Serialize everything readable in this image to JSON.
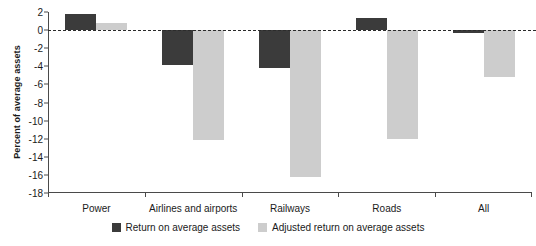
{
  "chart_data": {
    "type": "bar",
    "title": "",
    "xlabel": "",
    "ylabel": "Percent of average assets",
    "categories": [
      "Power",
      "Airlines and airports",
      "Railways",
      "Roads",
      "All"
    ],
    "series": [
      {
        "name": "Return on average assets",
        "color": "#3b3b3b",
        "values": [
          1.8,
          -3.9,
          -4.2,
          1.3,
          -0.3
        ]
      },
      {
        "name": "Adjusted return on average assets",
        "color": "#cdcdcd",
        "values": [
          0.8,
          -12.1,
          -16.2,
          -12.0,
          -5.2
        ]
      }
    ],
    "ylim": [
      -18,
      2
    ],
    "yticks": [
      2,
      0,
      -2,
      -4,
      -6,
      -8,
      -10,
      -12,
      -14,
      -16,
      -18
    ],
    "ytick_labels": [
      "2",
      "0",
      "-2",
      "-4",
      "-6",
      "-8",
      "-10",
      "-12",
      "-14",
      "-16",
      "-18"
    ],
    "grid": false,
    "zero_line": true,
    "zero_line_style": "dashed",
    "legend_position": "bottom-center"
  },
  "legend": {
    "items": [
      {
        "label": "Return on average assets",
        "swatch": "dark"
      },
      {
        "label": "Adjusted return on average assets",
        "swatch": "light"
      }
    ]
  }
}
